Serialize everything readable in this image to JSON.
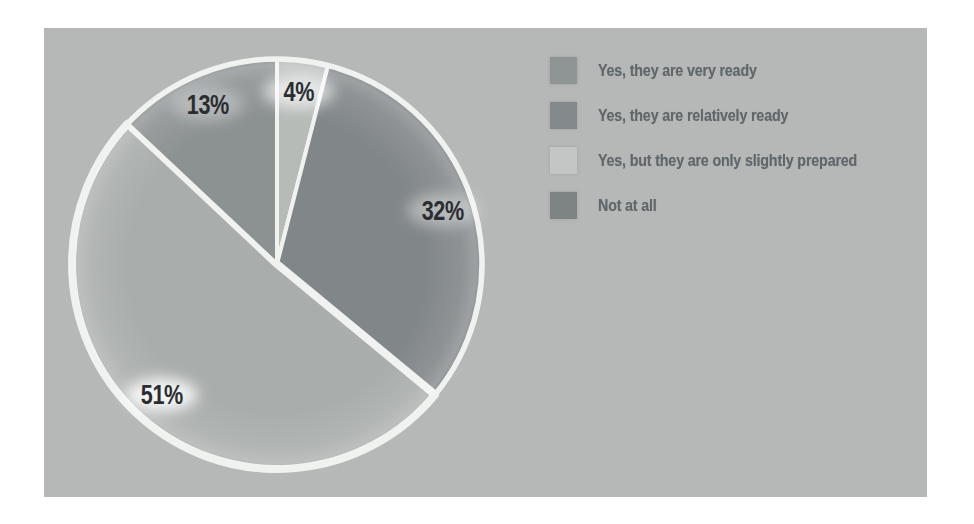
{
  "chart_data": {
    "type": "pie",
    "title": "",
    "legend_position": "right",
    "rotation_start": "12-oclock",
    "direction": "clockwise",
    "categories": [
      "Yes, they are very ready",
      "Yes, they are relatively ready",
      "Yes, but they are only slightly prepared",
      "Not at all"
    ],
    "values": [
      4,
      32,
      51,
      13
    ],
    "slices": [
      {
        "label": "Yes, they are very ready",
        "value": 4,
        "value_label": "4%",
        "slice_color": "#b7bbb8",
        "legend_color": "#8f9494"
      },
      {
        "label": "Yes, they are relatively ready",
        "value": 32,
        "value_label": "32%",
        "slice_color": "#818688",
        "legend_color": "#848a8b"
      },
      {
        "label": "Yes, but they are only slightly prepared",
        "value": 51,
        "value_label": "51%",
        "slice_color": "#a9adac",
        "legend_color": "#c3c6c4"
      },
      {
        "label": "Not at all",
        "value": 13,
        "value_label": "13%",
        "slice_color": "#8c9191",
        "legend_color": "#7e8384"
      }
    ]
  },
  "colors": {
    "page_background": "#ffffff",
    "panel_background": "#b5b8b6",
    "slice_separator": "#f0f2f0",
    "percent_label_color": "#2b2e30",
    "legend_text_color": "#60666a"
  }
}
